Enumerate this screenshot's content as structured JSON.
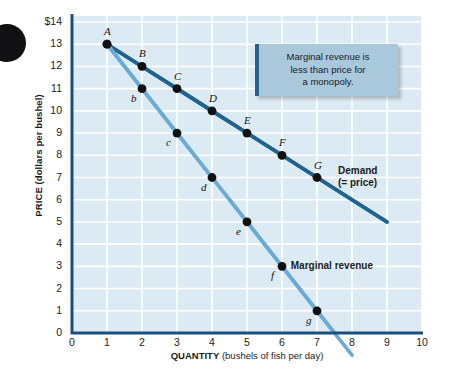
{
  "chart_data": {
    "type": "line",
    "title": "",
    "xlabel_bold": "QUANTITY",
    "xlabel_rest": "(bushels of fish per day)",
    "ylabel": "PRICE (dollars per bushel)",
    "xlim": [
      0,
      10
    ],
    "ylim": [
      0,
      14
    ],
    "xticks": [
      "0",
      "1",
      "2",
      "3",
      "4",
      "5",
      "6",
      "7",
      "8",
      "9",
      "10"
    ],
    "yticks": [
      "$14",
      "13",
      "12",
      "11",
      "10",
      "9",
      "8",
      "7",
      "6",
      "5",
      "4",
      "3",
      "2",
      "1",
      "0"
    ],
    "grid": true,
    "legend_position": "inline-right",
    "series": [
      {
        "name": "Demand (= price)",
        "label_line1": "Demand",
        "label_line2": "(= price)",
        "color": "#1f6390",
        "x": [
          1,
          2,
          3,
          4,
          5,
          6,
          7
        ],
        "y": [
          13,
          12,
          11,
          10,
          9,
          8,
          7
        ],
        "point_labels": [
          "A",
          "B",
          "C",
          "D",
          "E",
          "F",
          "G"
        ],
        "line_extends_to": [
          9,
          5
        ]
      },
      {
        "name": "Marginal revenue",
        "label_line1": "Marginal revenue",
        "color": "#6aaad6",
        "x": [
          1,
          2,
          3,
          4,
          5,
          6,
          7
        ],
        "y": [
          13,
          11,
          9,
          7,
          5,
          3,
          1
        ],
        "point_labels": [
          "A",
          "b",
          "c",
          "d",
          "e",
          "f",
          "g"
        ],
        "line_extends_to": [
          8,
          -1
        ]
      }
    ],
    "annotations": [
      {
        "id": "callout-monopoly",
        "line1": "Marginal revenue is",
        "line2": "less than price for",
        "line3": "a monopoly."
      }
    ],
    "colors": {
      "plot_background": "#dceaf3",
      "gridline": "#ffffff",
      "axis": "#1d4f7c",
      "demand": "#1f6390",
      "marginal_revenue": "#6aaad6",
      "point": "#111113",
      "callout_background": "#a9c8db",
      "callout_accent": "#2c5f85"
    }
  }
}
